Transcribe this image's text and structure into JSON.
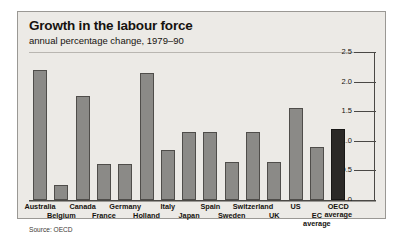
{
  "card": {
    "title": "Growth in the labour force",
    "subtitle": "annual percentage change, 1979–90",
    "source": "Source: OECD"
  },
  "chart_data": {
    "type": "bar",
    "title": "Growth in the labour force",
    "subtitle": "annual percentage change, 1979–90",
    "xlabel": "",
    "ylabel": "",
    "ylim": [
      0,
      2.5
    ],
    "yticks": [
      "0",
      "0.5",
      "1.0",
      "1.5",
      "2.0",
      "2.5"
    ],
    "ytick_values": [
      0,
      0.5,
      1.0,
      1.5,
      2.0,
      2.5
    ],
    "axis_position": "right",
    "grid": false,
    "legend": "none",
    "source": "Source: OECD",
    "categories": [
      "Australia",
      "Belgium",
      "Canada",
      "France",
      "Germany",
      "Holland",
      "Italy",
      "Japan",
      "Spain",
      "Sweden",
      "Switzerland",
      "UK",
      "US",
      "EC average",
      "OECD average"
    ],
    "values": [
      2.2,
      0.25,
      1.75,
      0.6,
      0.6,
      2.15,
      0.85,
      1.15,
      1.15,
      0.65,
      1.15,
      0.65,
      1.55,
      0.9,
      1.2
    ],
    "bar_colors": [
      "#8b8a87",
      "#8b8a87",
      "#8b8a87",
      "#8b8a87",
      "#8b8a87",
      "#8b8a87",
      "#8b8a87",
      "#8b8a87",
      "#8b8a87",
      "#8b8a87",
      "#8b8a87",
      "#8b8a87",
      "#8b8a87",
      "#8b8a87",
      "#2b2927"
    ],
    "label_rows": [
      0,
      1,
      0,
      1,
      0,
      1,
      0,
      1,
      0,
      1,
      0,
      1,
      0,
      1,
      0
    ],
    "label_lines": [
      [
        "Australia"
      ],
      [
        "Belgium"
      ],
      [
        "Canada"
      ],
      [
        "France"
      ],
      [
        "Germany"
      ],
      [
        "Holland"
      ],
      [
        "Italy"
      ],
      [
        "Japan"
      ],
      [
        "Spain"
      ],
      [
        "Sweden"
      ],
      [
        "Switzerland"
      ],
      [
        "UK"
      ],
      [
        "US"
      ],
      [
        "EC",
        "average"
      ],
      [
        "OECD",
        "average"
      ]
    ]
  }
}
